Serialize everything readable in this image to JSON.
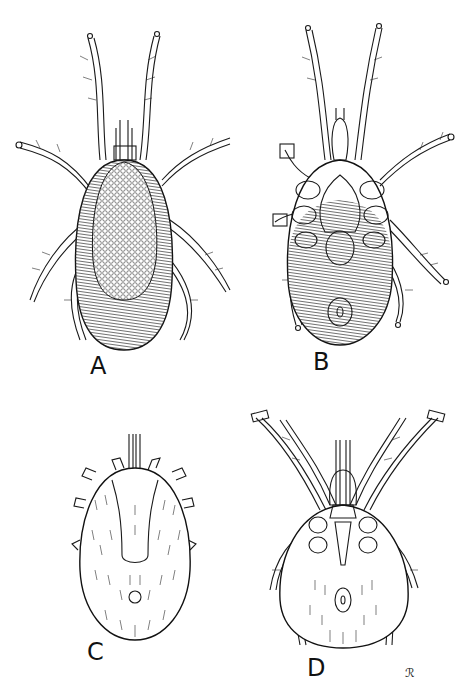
{
  "figure": {
    "panels": [
      {
        "id": "A",
        "label": "A",
        "view": "dorsal view, reticulated dorsal shield, striated body"
      },
      {
        "id": "B",
        "label": "B",
        "view": "ventral view, striated body, genital plate"
      },
      {
        "id": "C",
        "label": "C",
        "view": "dorsal view, oval setose body, short legs"
      },
      {
        "id": "D",
        "label": "D",
        "view": "ventral view, long legs, setose opisthosoma"
      }
    ],
    "signature": "ℛ",
    "colors": {
      "background": "#ffffff",
      "ink": "#1a1a1a"
    }
  }
}
